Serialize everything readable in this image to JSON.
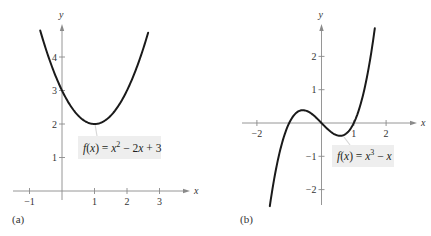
{
  "chart_data": [
    {
      "id": "a",
      "type": "line",
      "panel_label": "(a)",
      "title": "",
      "function": "f(x) = x^2 - 2x + 3",
      "label_parts": {
        "f": "f",
        "x": "x",
        "eq": ") = ",
        "x2": "x",
        "sup": "2",
        "rest": " − 2",
        "xr": "x",
        "tail": " + 3"
      },
      "xlabel": "x",
      "ylabel": "y",
      "xlim": [
        -1.35,
        3.9
      ],
      "ylim": [
        -0.2,
        5.0
      ],
      "domain_plotted": [
        -0.67,
        2.65
      ],
      "x_ticks": [
        -1,
        1,
        2,
        3
      ],
      "x_tick_labels": [
        "−1",
        "1",
        "2",
        "3"
      ],
      "y_ticks": [
        1,
        2,
        3,
        4
      ],
      "y_tick_labels": [
        "1",
        "2",
        "3",
        "4"
      ],
      "key_points": [
        {
          "x": 0,
          "y": 3
        },
        {
          "x": 1,
          "y": 2
        },
        {
          "x": 2,
          "y": 3
        }
      ],
      "grid": false,
      "pixel": {
        "ox": 62,
        "oy": 191,
        "sx": 32.5,
        "sy": 33.5,
        "xmin_px": 13,
        "xmax_px": 190,
        "ymin_px": 200,
        "ymax_px": 24
      },
      "label_box": {
        "x": 78,
        "y": 136,
        "w": 83,
        "h": 23
      },
      "pointer": [
        95,
        124,
        97,
        136
      ]
    },
    {
      "id": "b",
      "type": "line",
      "panel_label": "(b)",
      "title": "",
      "function": "f(x) = x^3 - x",
      "label_parts": {
        "f": "f",
        "x": "x",
        "eq": ") = ",
        "x2": "x",
        "sup": "3",
        "rest": " − ",
        "xr": "x",
        "tail": ""
      },
      "xlabel": "x",
      "ylabel": "y",
      "xlim": [
        -2.45,
        2.95
      ],
      "ylim": [
        -2.5,
        2.95
      ],
      "domain_plotted": [
        -1.6,
        1.65
      ],
      "x_ticks": [
        -2,
        1,
        2
      ],
      "x_tick_labels": [
        "−2",
        "1",
        "2"
      ],
      "y_ticks": [
        -2,
        -1,
        1,
        2
      ],
      "y_tick_labels": [
        "−2",
        "−1",
        "1",
        "2"
      ],
      "key_points": [
        {
          "x": -1,
          "y": 0
        },
        {
          "x": 0,
          "y": 0
        },
        {
          "x": 1,
          "y": 0
        },
        {
          "x": -0.577,
          "y": 0.385
        },
        {
          "x": 0.577,
          "y": -0.385
        }
      ],
      "grid": false,
      "pixel": {
        "ox": 321.5,
        "oy": 123,
        "sx": 32.3,
        "sy": 33.3,
        "xmin_px": 242,
        "xmax_px": 417,
        "ymin_px": 205,
        "ymax_px": 24
      },
      "label_box": {
        "x": 332,
        "y": 145,
        "w": 62,
        "h": 22
      },
      "pointer": [
        344,
        137,
        350,
        145
      ]
    }
  ]
}
